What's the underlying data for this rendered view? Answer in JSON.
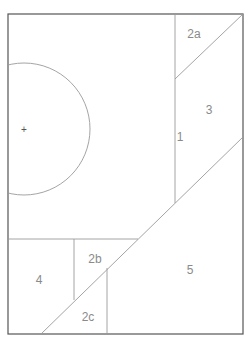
{
  "diagram": {
    "type": "floor-plan-regions",
    "colors": {
      "outline": "#555555",
      "inner_lines": "#9a9a9a",
      "label": "#8a8a8a"
    },
    "regions": [
      {
        "id": "1",
        "label": "1",
        "x": 180,
        "y": 137
      },
      {
        "id": "2a",
        "label": "2a",
        "x": 194,
        "y": 34
      },
      {
        "id": "3",
        "label": "3",
        "x": 209,
        "y": 110
      },
      {
        "id": "2b",
        "label": "2b",
        "x": 95,
        "y": 259
      },
      {
        "id": "4",
        "label": "4",
        "x": 39,
        "y": 280
      },
      {
        "id": "5",
        "label": "5",
        "x": 190,
        "y": 270
      },
      {
        "id": "2c",
        "label": "2c",
        "x": 88,
        "y": 317
      }
    ],
    "center_marker": {
      "symbol": "+",
      "x": 24,
      "y": 129
    }
  }
}
